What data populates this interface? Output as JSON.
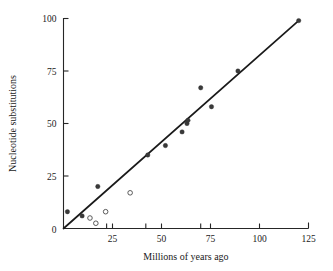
{
  "chart_data": {
    "type": "scatter",
    "title": "",
    "xlabel": "Millions of years ago",
    "ylabel": "Nucleotide substitutions",
    "xlim": [
      0,
      125
    ],
    "ylim": [
      0,
      100
    ],
    "grid": false,
    "legend_position": "none",
    "xticks": [
      0,
      25,
      50,
      75,
      100,
      125
    ],
    "xtick_labels": [
      "0",
      "25",
      "50",
      "75",
      "100",
      "125"
    ],
    "yticks": [
      0,
      25,
      50,
      75,
      100
    ],
    "ytick_labels": [
      "0",
      "25",
      "50",
      "75",
      "100"
    ],
    "x_minor_ticks": [
      22,
      42,
      70
    ],
    "series": [
      {
        "name": "closed-circles",
        "marker": "filled-circle",
        "color": "#3a3a3a",
        "points": [
          {
            "x": 2.0,
            "y": 8.0
          },
          {
            "x": 9.5,
            "y": 6.0
          },
          {
            "x": 17.5,
            "y": 20.0
          },
          {
            "x": 43.0,
            "y": 35.0
          },
          {
            "x": 52.0,
            "y": 39.5
          },
          {
            "x": 60.5,
            "y": 46.0
          },
          {
            "x": 63.0,
            "y": 50.0
          },
          {
            "x": 63.5,
            "y": 51.5
          },
          {
            "x": 70.0,
            "y": 67.0
          },
          {
            "x": 75.5,
            "y": 58.0
          },
          {
            "x": 89.0,
            "y": 75.0
          },
          {
            "x": 120.0,
            "y": 99.0
          }
        ]
      },
      {
        "name": "open-circles",
        "marker": "open-circle",
        "color": "#ffffff",
        "points": [
          {
            "x": 13.5,
            "y": 5.0
          },
          {
            "x": 16.5,
            "y": 2.5
          },
          {
            "x": 21.5,
            "y": 8.0
          },
          {
            "x": 34.0,
            "y": 17.0
          }
        ]
      }
    ],
    "fit_line": {
      "name": "regression-line",
      "x0": 0.0,
      "y0": 0.0,
      "x1": 120.0,
      "y1": 99.0,
      "color": "#1a1a1a"
    }
  },
  "colors": {
    "axis": "#262626",
    "closed_marker": "#3a3a3a",
    "open_marker_stroke": "#4a4a4a",
    "fit_line": "#1a1a1a",
    "background": "#ffffff"
  }
}
